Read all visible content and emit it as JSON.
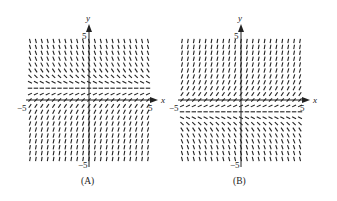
{
  "chart_data": [
    {
      "type": "slope-field",
      "title": "(A)",
      "equation_hint": "dy/dx depends only on y; equilibrium near y = 1; slopes negative above, positive below",
      "xlabel": "x",
      "ylabel": "y",
      "xlim": [
        -5,
        5
      ],
      "ylim": [
        -5,
        5
      ],
      "x_tick_labels": [
        "-5",
        "5"
      ],
      "y_tick_labels": [
        "5",
        "-5"
      ],
      "equilibrium_y": 1,
      "slope_sign_above": "negative",
      "slope_sign_below": "positive",
      "grid_step": 0.5,
      "grid": false
    },
    {
      "type": "slope-field",
      "title": "(B)",
      "equation_hint": "dy/dx depends only on y; equilibrium near y = -1; slopes positive above, negative below",
      "xlabel": "x",
      "ylabel": "y",
      "xlim": [
        -5,
        5
      ],
      "ylim": [
        -5,
        5
      ],
      "x_tick_labels": [
        "-5",
        "5"
      ],
      "y_tick_labels": [
        "5",
        "-5"
      ],
      "equilibrium_y": -1,
      "slope_sign_above": "positive",
      "slope_sign_below": "negative",
      "grid_step": 0.5,
      "grid": false
    }
  ],
  "panels": [
    {
      "caption": "(A)",
      "x_axis_label": "x",
      "y_axis_label": "y",
      "tick_neg5_x": "−5",
      "tick_pos5_x": "5",
      "tick_pos5_y": "5",
      "tick_neg5_y": "−5"
    },
    {
      "caption": "(B)",
      "x_axis_label": "x",
      "y_axis_label": "y",
      "tick_neg5_x": "−5",
      "tick_pos5_x": "5",
      "tick_pos5_y": "5",
      "tick_neg5_y": "−5"
    }
  ],
  "colors": {
    "ink": "#222222",
    "background": "#ffffff"
  }
}
